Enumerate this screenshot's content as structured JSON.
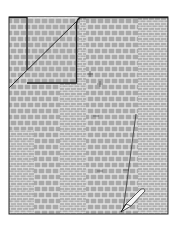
{
  "diagram": {
    "texture": "crocodile-embossed",
    "colors": {
      "background": "#ffffff",
      "sheet_fill": "#a9a9a9",
      "scale_lines": "#e6e6e6",
      "outline": "#2b2b2b",
      "fold_fill": "#b3b3b3",
      "pen_body": "#f4f4f4",
      "pen_outline": "#333333"
    },
    "sheet": {
      "x": 9,
      "y": 17,
      "width": 159,
      "height": 197
    },
    "fold": {
      "x": 9,
      "y": 17,
      "width": 67,
      "height": 66,
      "inner_edge_x": 27
    },
    "diagonal": {
      "x1": 9,
      "y1": 88,
      "x2": 80,
      "y2": 18
    },
    "cut_line": {
      "x1": 136,
      "y1": 114,
      "x2": 123,
      "y2": 211
    },
    "marks": [
      {
        "x": 90,
        "y": 74
      },
      {
        "x": 100,
        "y": 84
      },
      {
        "x": 96,
        "y": 116
      },
      {
        "x": 126,
        "y": 170
      },
      {
        "x": 100,
        "y": 171
      }
    ],
    "tool": {
      "name": "pen-knife-icon",
      "tip_x": 121,
      "tip_y": 212,
      "end_x": 143,
      "end_y": 192
    }
  }
}
